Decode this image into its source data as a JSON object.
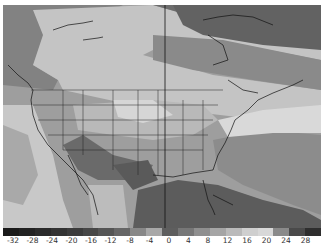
{
  "map": {
    "region": "North America",
    "style": "grayscale shaded anomaly field with coastline, state and province borders",
    "meridian_line_x": 165
  },
  "colorbar": {
    "tick_labels": [
      "-32",
      "-28",
      "-24",
      "-20",
      "-16",
      "-12",
      "-8",
      "-4",
      "0",
      "4",
      "8",
      "12",
      "16",
      "20",
      "24",
      "28"
    ],
    "swatch_colors": [
      "#1a1a1a",
      "#222222",
      "#2a2a2a",
      "#333333",
      "#3c3c3c",
      "#474747",
      "#555555",
      "#666666",
      "#888888",
      "#a8a8a8",
      "#5e5e5e",
      "#777777",
      "#8f8f8f",
      "#a5a5a5",
      "#bababa",
      "#cfcfcf",
      "#d8d8d8",
      "#8a8a8a",
      "#4a4a4a",
      "#2e2e2e"
    ]
  },
  "chart_data": {
    "type": "heatmap",
    "title": "",
    "colorbar_ticks": [
      -32,
      -28,
      -24,
      -20,
      -16,
      -12,
      -8,
      -4,
      0,
      4,
      8,
      12,
      16,
      20,
      24,
      28
    ],
    "colorbar_range": [
      -32,
      30
    ],
    "regions": [
      {
        "area": "Northern Canada / Arctic",
        "approx_value": 4
      },
      {
        "area": "Western Canada / Alaska coast",
        "approx_value": 8
      },
      {
        "area": "Central Canada",
        "approx_value": 16
      },
      {
        "area": "Pacific Ocean off California",
        "approx_value": 16
      },
      {
        "area": "Northern US / Great Lakes",
        "approx_value": 20
      },
      {
        "area": "Desert Southwest / Mexico",
        "approx_value": -4
      },
      {
        "area": "Texas / Gulf of Mexico",
        "approx_value": -8
      },
      {
        "area": "Southeast US / Florida / Caribbean",
        "approx_value": -8
      },
      {
        "area": "Western Atlantic",
        "approx_value": 4
      },
      {
        "area": "Mid-Atlantic offshore band",
        "approx_value": 20
      }
    ]
  }
}
